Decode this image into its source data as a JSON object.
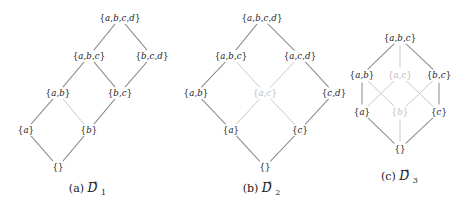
{
  "figure": {
    "width": 473,
    "height": 207,
    "background": "#ffffff",
    "edge_color": "#8e8e8e",
    "dim_edge_color": "#c9c9c9",
    "node_color": "#1a1a1a",
    "dim_node_color": "#bdbdbd",
    "panels": [
      {
        "id": "panel-a",
        "caption_prefix": "(a)",
        "caption_symbol": "D",
        "caption_sub": "1",
        "caption_sup": "*",
        "caption_x": 88,
        "caption_y": 182,
        "nodes": [
          {
            "id": "abcd",
            "label": "{a,b,c,d}",
            "x": 120,
            "y": 18,
            "dim": false
          },
          {
            "id": "abc",
            "label": "{a,b,c}",
            "x": 89,
            "y": 56,
            "dim": false
          },
          {
            "id": "bcd",
            "label": "{b,c,d}",
            "x": 152,
            "y": 56,
            "dim": false
          },
          {
            "id": "ab",
            "label": "{a,b}",
            "x": 58,
            "y": 93,
            "dim": false
          },
          {
            "id": "bc",
            "label": "{b,c}",
            "x": 120,
            "y": 93,
            "dim": false
          },
          {
            "id": "a",
            "label": "{a}",
            "x": 26,
            "y": 130,
            "dim": false
          },
          {
            "id": "b",
            "label": "{b}",
            "x": 89,
            "y": 130,
            "dim": false
          },
          {
            "id": "empty",
            "label": "{}",
            "x": 58,
            "y": 167,
            "dim": false
          }
        ],
        "edges": [
          {
            "from": "abcd",
            "to": "abc",
            "dim": false
          },
          {
            "from": "abcd",
            "to": "bcd",
            "dim": false
          },
          {
            "from": "abc",
            "to": "ab",
            "dim": false
          },
          {
            "from": "abc",
            "to": "bc",
            "dim": false
          },
          {
            "from": "bcd",
            "to": "bc",
            "dim": false
          },
          {
            "from": "ab",
            "to": "a",
            "dim": false
          },
          {
            "from": "ab",
            "to": "b",
            "dim": true
          },
          {
            "from": "bc",
            "to": "b",
            "dim": false
          },
          {
            "from": "a",
            "to": "empty",
            "dim": false
          },
          {
            "from": "b",
            "to": "empty",
            "dim": false
          }
        ]
      },
      {
        "id": "panel-b",
        "caption_prefix": "(b)",
        "caption_symbol": "D",
        "caption_sub": "2",
        "caption_sup": "*",
        "caption_x": 262,
        "caption_y": 182,
        "nodes": [
          {
            "id": "abcd",
            "label": "{a,b,c,d}",
            "x": 262,
            "y": 18,
            "dim": false
          },
          {
            "id": "abc",
            "label": "{a,b,c}",
            "x": 231,
            "y": 56,
            "dim": false
          },
          {
            "id": "acd",
            "label": "{a,c,d}",
            "x": 300,
            "y": 56,
            "dim": false
          },
          {
            "id": "ab",
            "label": "{a,b}",
            "x": 196,
            "y": 93,
            "dim": false
          },
          {
            "id": "ac",
            "label": "{a,c}",
            "x": 265,
            "y": 93,
            "dim": true
          },
          {
            "id": "cd",
            "label": "{c,d}",
            "x": 334,
            "y": 93,
            "dim": false
          },
          {
            "id": "a",
            "label": "{a}",
            "x": 231,
            "y": 130,
            "dim": false
          },
          {
            "id": "c",
            "label": "{c}",
            "x": 300,
            "y": 130,
            "dim": false
          },
          {
            "id": "empty",
            "label": "{}",
            "x": 265,
            "y": 167,
            "dim": false
          }
        ],
        "edges": [
          {
            "from": "abcd",
            "to": "abc",
            "dim": false
          },
          {
            "from": "abcd",
            "to": "acd",
            "dim": false
          },
          {
            "from": "abc",
            "to": "ab",
            "dim": false
          },
          {
            "from": "abc",
            "to": "ac",
            "dim": true
          },
          {
            "from": "acd",
            "to": "ac",
            "dim": true
          },
          {
            "from": "acd",
            "to": "cd",
            "dim": false
          },
          {
            "from": "ab",
            "to": "a",
            "dim": false
          },
          {
            "from": "ac",
            "to": "a",
            "dim": true
          },
          {
            "from": "ac",
            "to": "c",
            "dim": true
          },
          {
            "from": "cd",
            "to": "c",
            "dim": false
          },
          {
            "from": "a",
            "to": "empty",
            "dim": false
          },
          {
            "from": "c",
            "to": "empty",
            "dim": false
          }
        ]
      },
      {
        "id": "panel-c",
        "caption_prefix": "(c)",
        "caption_symbol": "D",
        "caption_sub": "3",
        "caption_sup": "*",
        "caption_x": 400,
        "caption_y": 170,
        "nodes": [
          {
            "id": "abc",
            "label": "{a,b,c}",
            "x": 400,
            "y": 38,
            "dim": false
          },
          {
            "id": "ab",
            "label": "{a,b}",
            "x": 362,
            "y": 75,
            "dim": false
          },
          {
            "id": "ac",
            "label": "{a,c}",
            "x": 400,
            "y": 75,
            "dim": true
          },
          {
            "id": "bc",
            "label": "{b,c}",
            "x": 439,
            "y": 75,
            "dim": false
          },
          {
            "id": "a",
            "label": "{a}",
            "x": 362,
            "y": 112,
            "dim": false
          },
          {
            "id": "b",
            "label": "{b}",
            "x": 400,
            "y": 112,
            "dim": true
          },
          {
            "id": "c",
            "label": "{c}",
            "x": 439,
            "y": 112,
            "dim": false
          },
          {
            "id": "empty",
            "label": "{}",
            "x": 400,
            "y": 149,
            "dim": false
          }
        ],
        "edges": [
          {
            "from": "abc",
            "to": "ab",
            "dim": false
          },
          {
            "from": "abc",
            "to": "ac",
            "dim": true
          },
          {
            "from": "abc",
            "to": "bc",
            "dim": false
          },
          {
            "from": "ab",
            "to": "a",
            "dim": false
          },
          {
            "from": "ab",
            "to": "b",
            "dim": true
          },
          {
            "from": "ac",
            "to": "a",
            "dim": true
          },
          {
            "from": "ac",
            "to": "c",
            "dim": true
          },
          {
            "from": "bc",
            "to": "b",
            "dim": true
          },
          {
            "from": "bc",
            "to": "c",
            "dim": false
          },
          {
            "from": "a",
            "to": "empty",
            "dim": false
          },
          {
            "from": "b",
            "to": "empty",
            "dim": true
          },
          {
            "from": "c",
            "to": "empty",
            "dim": false
          }
        ]
      }
    ]
  }
}
